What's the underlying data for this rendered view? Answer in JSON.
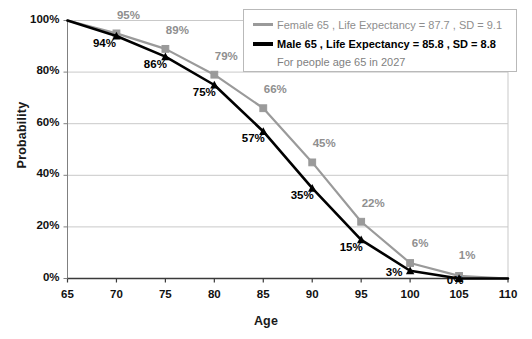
{
  "chart_data": {
    "type": "line",
    "title": "",
    "xlabel": "Age",
    "ylabel": "Probability",
    "xlim": [
      65,
      110
    ],
    "ylim": [
      0,
      100
    ],
    "xticks": [
      "65",
      "70",
      "75",
      "80",
      "85",
      "90",
      "95",
      "100",
      "105",
      "110"
    ],
    "yticks": [
      "0%",
      "20%",
      "40%",
      "60%",
      "80%",
      "100%"
    ],
    "grid": "horizontal",
    "legend_position": "top-right",
    "x": [
      65,
      70,
      75,
      80,
      85,
      90,
      95,
      100,
      105,
      110
    ],
    "series": [
      {
        "name": "Female",
        "color": "#9a9a9a",
        "marker": "square",
        "values": [
          100,
          95,
          89,
          79,
          66,
          45,
          22,
          6,
          1,
          0
        ],
        "labels": [
          "",
          "95%",
          "89%",
          "79%",
          "66%",
          "45%",
          "22%",
          "6%",
          "1%",
          ""
        ]
      },
      {
        "name": "Male",
        "color": "#000000",
        "marker": "triangle",
        "values": [
          100,
          94,
          86,
          75,
          57,
          35,
          15,
          3,
          0,
          0
        ],
        "labels": [
          "",
          "94%",
          "86%",
          "75%",
          "57%",
          "35%",
          "15%",
          "3%",
          "0%",
          ""
        ]
      }
    ]
  },
  "legend": {
    "female": {
      "label": "Female",
      "text": "Female  65 , Life Expectancy = 87.7 , SD = 9.1",
      "age": "65",
      "life_expectancy": "87.7",
      "sd": "9.1"
    },
    "male": {
      "label": "Male",
      "text": "Male      65 , Life Expectancy = 85.8 , SD = 8.8",
      "age": "65",
      "life_expectancy": "85.8",
      "sd": "8.8"
    },
    "note": "For people age 65 in 2027"
  },
  "axes": {
    "y_title": "Probability",
    "x_title": "Age"
  }
}
